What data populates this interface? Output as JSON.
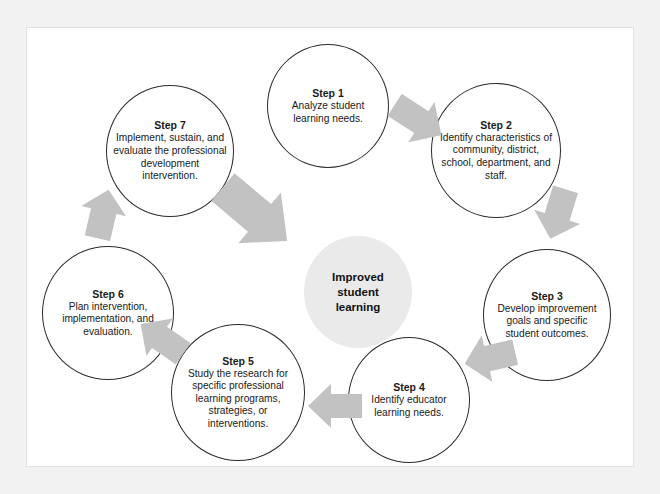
{
  "diagram": {
    "title_center": "Improved\nstudent\nlearning",
    "center_label": "Improved student learning",
    "center_lines": [
      "Improved",
      "student",
      "learning"
    ],
    "frame_color": "#f2f2f2",
    "panel_color": "#ffffff",
    "node_border_color": "#2b2b2b",
    "arrow_color": "#c2c2c2",
    "center_fill": "#eaeaea",
    "text_color": "#1a1a1a",
    "steps": [
      {
        "id": "step-1",
        "title": "Step 1",
        "body": "Analyze student learning needs."
      },
      {
        "id": "step-2",
        "title": "Step 2",
        "body": "Identify characteristics of community, district, school, department, and staff."
      },
      {
        "id": "step-3",
        "title": "Step 3",
        "body": "Develop improvement goals and specific student outcomes."
      },
      {
        "id": "step-4",
        "title": "Step 4",
        "body": "Identify educator learning needs."
      },
      {
        "id": "step-5",
        "title": "Step 5",
        "body": "Study the research for specific professional learning programs, strategies, or interventions."
      },
      {
        "id": "step-6",
        "title": "Step 6",
        "body": "Plan intervention, implementation, and evaluation."
      },
      {
        "id": "step-7",
        "title": "Step 7",
        "body": "Implement, sustain, and evaluate the professional development intervention."
      }
    ],
    "arrows": [
      {
        "id": "arrow-step1-step2",
        "from": "Step 1",
        "to": "Step 2"
      },
      {
        "id": "arrow-step2-step3",
        "from": "Step 2",
        "to": "Step 3"
      },
      {
        "id": "arrow-step3-step4",
        "from": "Step 3",
        "to": "Step 4"
      },
      {
        "id": "arrow-step4-step5",
        "from": "Step 4",
        "to": "Step 5"
      },
      {
        "id": "arrow-step5-step6",
        "from": "Step 5",
        "to": "Step 6"
      },
      {
        "id": "arrow-step6-step7",
        "from": "Step 6",
        "to": "Step 7"
      },
      {
        "id": "arrow-step7-center",
        "from": "Step 7",
        "to": "Improved student learning"
      }
    ]
  }
}
